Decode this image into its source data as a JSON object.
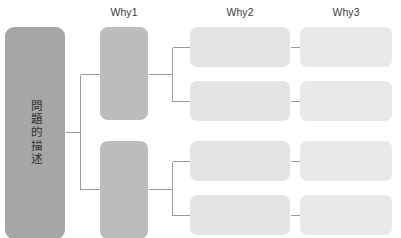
{
  "diagram": {
    "background_color": "#ffffff",
    "line_color": "#9a9a9a",
    "columns": [
      {
        "id": "why1",
        "label": "Why1",
        "x": 124,
        "y": 12
      },
      {
        "id": "why2",
        "label": "Why2",
        "x": 240,
        "y": 12
      },
      {
        "id": "why3",
        "label": "Why3",
        "x": 346,
        "y": 12
      }
    ],
    "problem": {
      "label": "問題的描述",
      "color": "#a6a6a6",
      "x": 5,
      "y": 27,
      "w": 60,
      "h": 212
    },
    "why1_nodes": [
      {
        "label": "",
        "color": "#bcbcbc",
        "x": 100,
        "y": 27,
        "w": 48,
        "h": 93
      },
      {
        "label": "",
        "color": "#bcbcbc",
        "x": 100,
        "y": 141,
        "w": 48,
        "h": 98
      }
    ],
    "why2_nodes": [
      {
        "label": "",
        "color": "#e4e4e4",
        "x": 190,
        "y": 27,
        "w": 100,
        "h": 40
      },
      {
        "label": "",
        "color": "#e4e4e4",
        "x": 190,
        "y": 81,
        "w": 100,
        "h": 40
      },
      {
        "label": "",
        "color": "#e4e4e4",
        "x": 190,
        "y": 141,
        "w": 100,
        "h": 40
      },
      {
        "label": "",
        "color": "#e4e4e4",
        "x": 190,
        "y": 195,
        "w": 100,
        "h": 40
      }
    ],
    "why3_nodes": [
      {
        "label": "",
        "color": "#e9e9e9",
        "x": 300,
        "y": 27,
        "w": 92,
        "h": 40
      },
      {
        "label": "",
        "color": "#e9e9e9",
        "x": 300,
        "y": 81,
        "w": 92,
        "h": 40
      },
      {
        "label": "",
        "color": "#e9e9e9",
        "x": 300,
        "y": 141,
        "w": 92,
        "h": 40
      },
      {
        "label": "",
        "color": "#e9e9e9",
        "x": 300,
        "y": 195,
        "w": 92,
        "h": 40
      }
    ]
  }
}
